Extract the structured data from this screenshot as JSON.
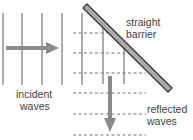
{
  "diagram": {
    "labels": {
      "barrier_line1": "straight",
      "barrier_line2": "barrier",
      "incident_line1": "incident",
      "incident_line2": "waves",
      "reflected_line1": "reflected",
      "reflected_line2": "waves"
    },
    "colors": {
      "wavefront": "#999999",
      "arrow": "#8a8a8a",
      "barrier_fill": "#aaaaaa",
      "barrier_stroke": "#333333",
      "dashed": "#777777"
    },
    "incident_wavefront_count": 5,
    "reflected_wavefront_count": 6
  }
}
